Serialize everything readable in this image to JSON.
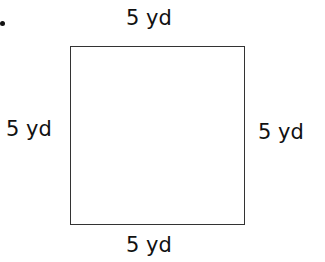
{
  "figure": {
    "shape": "square",
    "sides": {
      "top": "5 yd",
      "left": "5 yd",
      "right": "5 yd",
      "bottom": "5 yd"
    },
    "line_color": "#333333",
    "bullet": "•"
  }
}
